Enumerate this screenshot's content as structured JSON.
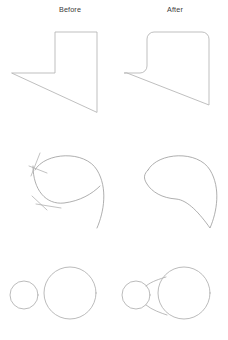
{
  "figure": {
    "background_color": "#ffffff",
    "stroke_color": "#b4b4b4",
    "columns": [
      {
        "key": "before",
        "label": "Before"
      },
      {
        "key": "after",
        "label": "After"
      }
    ],
    "rows": [
      {
        "id": "row-fillet",
        "operation": "fillet-corners",
        "description": "Sharp-cornered polygon becomes a polygon with rounded corners",
        "before": {
          "shape": "polygon",
          "corner_style": "sharp",
          "vertex_count": 5,
          "points": "12,73 55,73 55,32 97,32 97,112",
          "closed": true
        },
        "after": {
          "shape": "polygon",
          "corner_style": "rounded",
          "vertex_count": 5,
          "fillet_radius": 7,
          "path": "M 124.5,73 L 140,73 A 7 7 0 0 0 147,66 L 147,39 A 7 7 0 0 1 154,32 L 202,32 A 7 7 0 0 1 209,39 L 209,105 L 127,73 Z",
          "closed": true
        }
      },
      {
        "id": "row-trim-join",
        "operation": "trim-and-join-curves",
        "description": "Overlapping curves with overhanging tails become one clean closed loop",
        "before": {
          "shape": "open-curves",
          "curve_count": 2,
          "has_overhanging_tails": true,
          "tail_count": 4,
          "curve_a": "M 35,170 C 45,152 85,150 97,170 C 108,188 104,212 97,228",
          "curve_b": "M 33,166 C 33,190 46,205 64,203 C 80,201 92,194 100,186",
          "tails": [
            "M 40,153 L 31,176",
            "M 29,166 L 47,173",
            "M 32,196 L 47,210",
            "M 36,204 L 61,208"
          ]
        },
        "after": {
          "shape": "closed-curve",
          "curve_count": 1,
          "has_overhanging_tails": false,
          "path": "M 148,170 C 158,152 198,150 210,170 C 221,188 217,212 210,228 C 200,214 188,200 176,199 C 162,198 152,192 147,184 C 143,178 144,174 148,170 Z",
          "closed": true
        }
      },
      {
        "id": "row-blend",
        "operation": "blend-circles",
        "description": "Two separate circles become one body joined by a concave fillet bridge",
        "before": {
          "shape": "two-circles",
          "joined": false,
          "circles": [
            {
              "name": "small-circle",
              "cx": 24,
              "cy": 295,
              "r": 14
            },
            {
              "name": "large-circle",
              "cx": 70,
              "cy": 293,
              "r": 26
            }
          ]
        },
        "after": {
          "shape": "blended-circles",
          "joined": true,
          "blend_type": "concave-fillet-bridge",
          "circles": [
            {
              "name": "small-circle",
              "cx": 136,
              "cy": 295,
              "r": 14
            },
            {
              "name": "large-circle",
              "cx": 184,
              "cy": 293,
              "r": 26
            }
          ],
          "bridge_top": "M 146,286 C 152,281 160,279 166,277",
          "bridge_bottom": "M 146,305 C 152,310 161,313 167,315"
        }
      }
    ]
  }
}
